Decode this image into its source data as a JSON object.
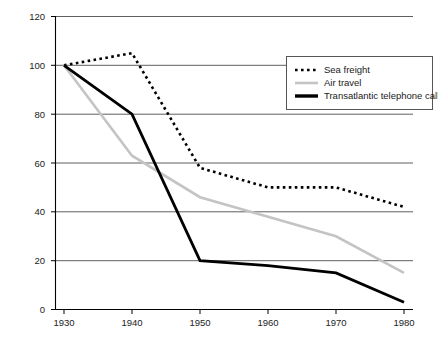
{
  "chart_data": {
    "type": "line",
    "title": "",
    "subtitle": "",
    "xlabel": "",
    "ylabel": "",
    "x": [
      1930,
      1940,
      1950,
      1960,
      1970,
      1980
    ],
    "categories": [
      "1930",
      "1940",
      "1950",
      "1960",
      "1970",
      "1980"
    ],
    "xlim": [
      1925,
      1985
    ],
    "ylim": [
      0,
      120
    ],
    "yticks": [
      0,
      20,
      40,
      60,
      80,
      100,
      120
    ],
    "ytick_labels": [
      "0",
      "20",
      "40",
      "60",
      "80",
      "100",
      "120"
    ],
    "xticks": [
      1930,
      1940,
      1950,
      1960,
      1970,
      1980
    ],
    "xtick_labels": [
      "1930",
      "1940",
      "1950",
      "1960",
      "1970",
      "1980"
    ],
    "grid": "horizontal",
    "legend_position": "top-right",
    "series": [
      {
        "name": "Sea freight",
        "values": [
          100,
          105,
          58,
          50,
          50,
          42
        ],
        "style": "dotted",
        "color": "#000000",
        "width": 2.6
      },
      {
        "name": "Air travel",
        "values": [
          100,
          63,
          46,
          38,
          30,
          15
        ],
        "style": "solid",
        "color": "#c4c4c4",
        "width": 2.6
      },
      {
        "name": "Transatlantic telephone call",
        "values": [
          100,
          80,
          20,
          18,
          15,
          3
        ],
        "style": "solid",
        "color": "#000000",
        "width": 2.8
      }
    ]
  },
  "legend": {
    "items": [
      {
        "label": "Sea freight"
      },
      {
        "label": "Air travel"
      },
      {
        "label": "Transatlantic telephone call"
      }
    ]
  },
  "axes": {
    "y_labels": [
      "120",
      "100",
      "80",
      "60",
      "40",
      "20",
      "0"
    ],
    "x_labels": [
      "1930",
      "1940",
      "1950",
      "1960",
      "1970",
      "1980"
    ]
  },
  "colors": {
    "axis": "#000000",
    "grid": "#4d4d4d",
    "series_dark": "#000000",
    "series_gray": "#c4c4c4",
    "legend_border": "#555555",
    "background": "#ffffff"
  }
}
